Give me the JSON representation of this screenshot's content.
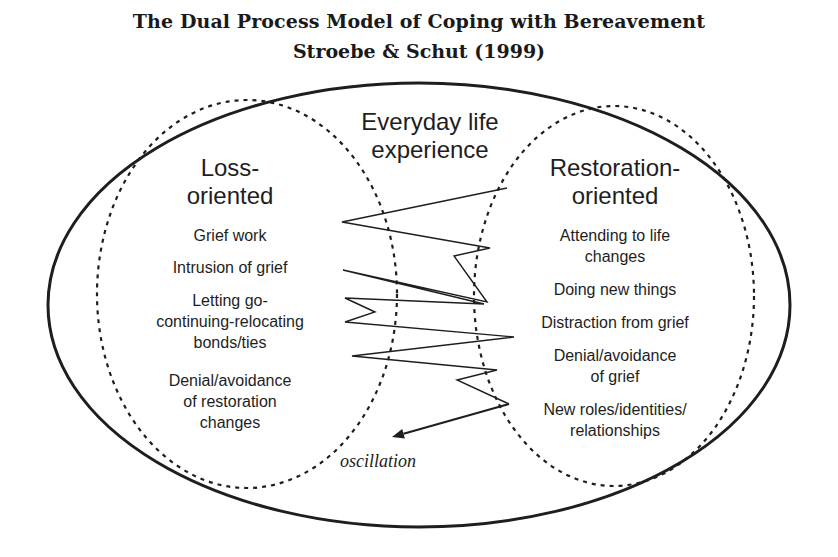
{
  "title": {
    "line1": "The Dual Process Model of Coping with Bereavement",
    "line2": "Stroebe & Schut (1999)"
  },
  "outer": {
    "label_line1": "Everyday life",
    "label_line2": "experience"
  },
  "loss": {
    "heading_line1": "Loss-",
    "heading_line2": "oriented",
    "items": [
      [
        "Grief work"
      ],
      [
        "Intrusion of grief"
      ],
      [
        "Letting go-",
        "continuing-relocating",
        "bonds/ties"
      ],
      [
        "Denial/avoidance",
        "of restoration",
        "changes"
      ]
    ]
  },
  "restoration": {
    "heading_line1": "Restoration-",
    "heading_line2": "oriented",
    "items": [
      [
        "Attending to life",
        "changes"
      ],
      [
        "Doing new things"
      ],
      [
        "Distraction from grief"
      ],
      [
        "Denial/avoidance",
        "of grief"
      ],
      [
        "New roles/identities/",
        "relationships"
      ]
    ]
  },
  "oscillation": {
    "label": "oscillation",
    "points": [
      [
        507,
        188
      ],
      [
        342,
        222
      ],
      [
        490,
        248
      ],
      [
        454,
        256
      ],
      [
        487,
        302
      ],
      [
        343,
        270
      ],
      [
        484,
        304
      ],
      [
        345,
        298
      ],
      [
        375,
        312
      ],
      [
        345,
        322
      ],
      [
        514,
        337
      ],
      [
        352,
        356
      ],
      [
        497,
        370
      ],
      [
        457,
        380
      ],
      [
        509,
        404
      ]
    ],
    "arrow_from": [
      509,
      404
    ],
    "arrow_to": [
      392,
      437
    ]
  },
  "colors": {
    "ink": "#1e1e1e",
    "background": "#ffffff"
  }
}
